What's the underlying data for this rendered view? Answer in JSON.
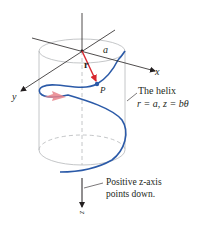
{
  "figure": {
    "axes": {
      "x_label": "x",
      "y_label": "y",
      "z_label": "z"
    },
    "labels": {
      "radius": "a",
      "vector": "r",
      "point": "P",
      "helix_title": "The helix",
      "helix_eq_r": "r = a,",
      "helix_eq_z": "z = bθ",
      "z_note_line1": "Positive z-axis",
      "z_note_line2": "points down."
    },
    "colors": {
      "helix": "#2b5aa8",
      "vector": "#d8262e",
      "direction_arrow": "#e8828a",
      "axes": "#231f20",
      "cylinder": "#a7a9ac"
    }
  }
}
